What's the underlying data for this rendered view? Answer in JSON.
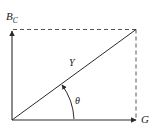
{
  "diagram": {
    "type": "admittance-triangle",
    "labels": {
      "vertical_axis": "B",
      "vertical_axis_sub": "C",
      "horizontal_axis": "G",
      "hypotenuse": "Y",
      "angle": "θ"
    },
    "colors": {
      "line": "#2a2a2a",
      "dashed": "#555555",
      "background": "#ffffff"
    }
  }
}
